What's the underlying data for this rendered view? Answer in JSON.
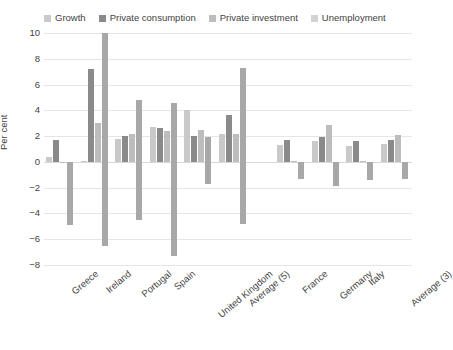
{
  "chart_data": {
    "type": "bar",
    "title": "",
    "xlabel": "",
    "ylabel": "Per cent",
    "ylim": [
      -8,
      10
    ],
    "ytick_step": 2,
    "yticks": [
      "10",
      "8",
      "6",
      "4",
      "2",
      "0",
      "-2",
      "-4",
      "-6",
      "-8"
    ],
    "grid": true,
    "legend_position": "top",
    "panels": [
      "Programme and stressed countries",
      "Other countries"
    ],
    "categories": [
      "Greece",
      "Ireland",
      "Portugal",
      "Spain",
      "United Kingdom",
      "Average (5)",
      "France",
      "Germany",
      "Italy",
      "Average (3)"
    ],
    "series": [
      {
        "name": "Growth",
        "color": "#c9c9c9",
        "values": [
          0.4,
          0.1,
          1.8,
          2.7,
          4.0,
          2.2,
          1.3,
          1.6,
          1.2,
          1.4
        ]
      },
      {
        "name": "Private consumption",
        "color": "#8a8a8a",
        "values": [
          1.7,
          7.2,
          2.0,
          2.6,
          2.0,
          3.6,
          1.7,
          1.9,
          1.6,
          1.7
        ]
      },
      {
        "name": "Private investment",
        "color": "#bdbdbd",
        "values": [
          0.0,
          3.0,
          2.2,
          2.4,
          2.5,
          2.2,
          0.1,
          2.9,
          0.1,
          2.1
        ]
      },
      {
        "name": "Unemployment",
        "color": "#a8a8a8",
        "values": [
          -4.9,
          -6.5,
          -4.5,
          -7.3,
          -1.7,
          -4.8,
          -1.3,
          -1.9,
          -1.4,
          -1.3
        ]
      }
    ],
    "unemployment_positive_tops": [
      0,
      10.0,
      4.8,
      4.6,
      1.9,
      7.3,
      0,
      0,
      0,
      0
    ]
  }
}
